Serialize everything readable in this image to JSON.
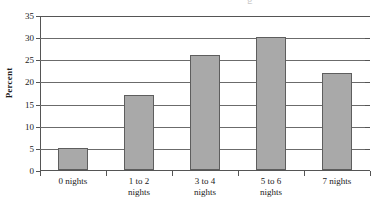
{
  "chart_data": {
    "type": "bar",
    "title": "",
    "title_remnant": "g",
    "xlabel": "",
    "ylabel": "Percent",
    "categories": [
      "0 nights",
      "1 to 2 nights",
      "3 to 4 nights",
      "5 to 6 nights",
      "7 nights"
    ],
    "category_lines": [
      [
        "0 nights"
      ],
      [
        "1 to 2",
        "nights"
      ],
      [
        "3 to 4",
        "nights"
      ],
      [
        "5 to 6",
        "nights"
      ],
      [
        "7 nights"
      ]
    ],
    "values": [
      5,
      17,
      26,
      30,
      22
    ],
    "ylim": [
      0,
      35
    ],
    "ytick_step": 5,
    "yticks": [
      0,
      5,
      10,
      15,
      20,
      25,
      30,
      35
    ],
    "ytick_labels": [
      "0",
      "5",
      "10",
      "15",
      "20",
      "25",
      "30",
      "35"
    ],
    "grid": true,
    "legend": false,
    "bar_color": "#a9a9a9",
    "bar_border_color": "#5e5e5e",
    "gridline_color": "#6b6b6b",
    "axis_color": "#555555",
    "background": "#ffffff"
  }
}
